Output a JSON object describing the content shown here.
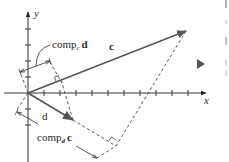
{
  "diagram": {
    "axes": {
      "x_label": "x",
      "y_label": "y"
    },
    "vectors": [
      {
        "name": "c",
        "label": "c",
        "bold": true
      },
      {
        "name": "d",
        "label": "d",
        "bold": true
      }
    ],
    "labels": {
      "comp_c_d_main": "comp",
      "comp_c_d_sub": "c",
      "comp_c_d_vec": "d",
      "comp_d_c_main": "comp",
      "comp_d_c_sub": "d",
      "comp_d_c_vec": "c",
      "vector_c": "c",
      "vector_d": "d"
    },
    "colors": {
      "axis": "#333333",
      "vector": "#555555",
      "dashed": "#444444",
      "text": "#2a2a2a",
      "marker": "#555555"
    }
  }
}
